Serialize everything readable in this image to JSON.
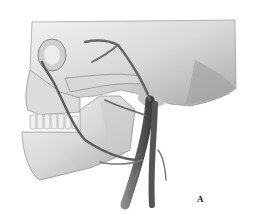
{
  "figure": {
    "panel_label": "A",
    "colors": {
      "background": "#ffffff",
      "bone_light": "#e6e6e6",
      "bone_mid": "#bdbdbd",
      "bone_dark": "#7a7a7a",
      "vessel": "#6e6e6e",
      "vessel_dark": "#4a4a4a"
    }
  }
}
